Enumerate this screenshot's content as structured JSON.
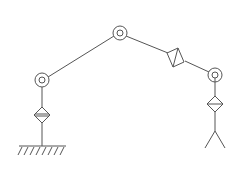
{
  "diagram": {
    "type": "kinematic-chain",
    "stroke_color": "#555555",
    "background": "#ffffff",
    "elements": [
      {
        "kind": "ground",
        "label": "base"
      },
      {
        "kind": "prismatic-joint",
        "label": "base-prismatic"
      },
      {
        "kind": "revolute-joint",
        "label": "shoulder"
      },
      {
        "kind": "link",
        "label": "upper-arm"
      },
      {
        "kind": "revolute-joint",
        "label": "elbow"
      },
      {
        "kind": "link",
        "label": "forearm"
      },
      {
        "kind": "prismatic-joint",
        "label": "forearm-prismatic"
      },
      {
        "kind": "revolute-joint",
        "label": "wrist"
      },
      {
        "kind": "prismatic-joint",
        "label": "wrist-prismatic"
      },
      {
        "kind": "gripper",
        "label": "end-effector"
      }
    ]
  }
}
